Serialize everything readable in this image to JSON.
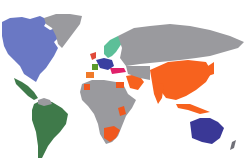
{
  "map": {
    "type": "world-choropleth",
    "background": "#ffffff",
    "colors": {
      "default_land": "#9a9a9e",
      "north_america": "#6a78c4",
      "latin_america": "#3f7a4a",
      "europe_north": "#5cbf98",
      "europe_west_red": "#e04a3a",
      "europe_blue": "#3a3fa0",
      "europe_green": "#5a9a2a",
      "europe_pink": "#e0206a",
      "europe_orange": "#f07a2a",
      "asia_orange": "#f7621e",
      "africa_orange": "#f0581e",
      "oceania": "#3a3896",
      "new_zealand": "#707078"
    },
    "regions": [
      {
        "name": "North America (Canada, USA)",
        "color_key": "north_america"
      },
      {
        "name": "Greenland",
        "color_key": "default_land"
      },
      {
        "name": "Central & South America",
        "color_key": "latin_america"
      },
      {
        "name": "Northern Europe",
        "color_key": "europe_north"
      },
      {
        "name": "Western / Central Europe",
        "color_key": "europe_blue"
      },
      {
        "name": "Russia & Central Asia",
        "color_key": "default_land"
      },
      {
        "name": "Middle East (partial)",
        "color_key": "asia_orange"
      },
      {
        "name": "South & East Asia",
        "color_key": "asia_orange"
      },
      {
        "name": "Africa (mostly)",
        "color_key": "default_land"
      },
      {
        "name": "Southern Africa & select African countries",
        "color_key": "africa_orange"
      },
      {
        "name": "Australia",
        "color_key": "oceania"
      },
      {
        "name": "New Zealand",
        "color_key": "new_zealand"
      }
    ]
  }
}
